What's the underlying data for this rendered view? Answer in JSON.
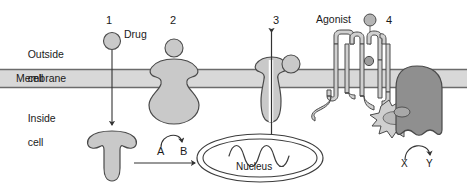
{
  "figure": {
    "width": 467,
    "height": 191
  },
  "compartments": {
    "outside_line1": "Outside",
    "outside_line2": "cell",
    "membrane": "Membrane",
    "inside_line1": "Inside",
    "inside_line2": "cell"
  },
  "numbers": {
    "one": "1",
    "two": "2",
    "three": "3",
    "four": "4"
  },
  "ligands": {
    "drug": "Drug",
    "agonist": "Agonist"
  },
  "reaction": {
    "substrate": "A",
    "product": "B"
  },
  "second_reaction": {
    "substrate": "X",
    "product": "Y"
  },
  "organelle": {
    "nucleus": "Nucleus"
  },
  "colors": {
    "background": "#ffffff",
    "protein_fill": "#c9c9c9",
    "protein_stroke": "#4a4a4a",
    "protein_dark_fill": "#8f8f8f",
    "membrane_fill": "#d8d8d8",
    "membrane_line": "#6b6b6b",
    "text": "#1a1a1a",
    "arrow": "#333333"
  },
  "icons": {
    "drug_ligand": "sphere-ligand-icon",
    "agonist_ligand": "sphere-ligand-icon",
    "nuclear_receptor": "nuclear-receptor-icon",
    "enzyme_linked_receptor": "enzyme-linked-receptor-icon",
    "ion_channel": "ion-channel-icon",
    "gpcr": "g-protein-coupled-receptor-icon",
    "g_protein": "g-protein-icon",
    "effector_enzyme": "effector-enzyme-icon",
    "dna_strand": "dna-wave-icon",
    "transport_arrow": "down-arrow-icon",
    "channel_flux_arrow": "double-headed-arrow-icon",
    "conversion_arrow": "curved-conversion-arrow-icon",
    "translocation_arrow": "right-arrow-icon"
  }
}
